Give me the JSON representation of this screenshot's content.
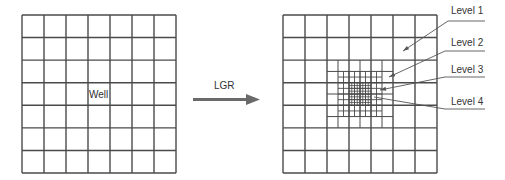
{
  "colors": {
    "grid": "#4a4a4a",
    "arrow": "#6a6a6a",
    "text": "#333333",
    "leader": "#555555"
  },
  "left_grid": {
    "label": "Well",
    "x": 22,
    "y": 15,
    "w": 154,
    "h": 158,
    "cols": 7,
    "rows": 7
  },
  "transition": {
    "label": "LGR"
  },
  "right_grid": {
    "x": 283,
    "y": 15,
    "w": 154,
    "h": 158,
    "cols": 7,
    "rows": 7,
    "levels": [
      {
        "name": "Level 1",
        "text_y": 7,
        "line_y": 21,
        "elbow_x": 448,
        "target": [
          403,
          51
        ]
      },
      {
        "name": "Level 2",
        "text_y": 39,
        "line_y": 51,
        "elbow_x": 445,
        "target": [
          389,
          77
        ]
      },
      {
        "name": "Level 3",
        "text_y": 66,
        "line_y": 77,
        "elbow_x": 445,
        "target": [
          380,
          90
        ]
      },
      {
        "name": "Level 4",
        "text_y": 98,
        "line_y": 109,
        "elbow_x": 445,
        "target": [
          374,
          97
        ]
      }
    ]
  }
}
